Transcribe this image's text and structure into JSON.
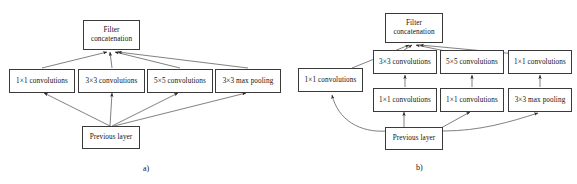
{
  "figure": {
    "background_color": "#ffffff",
    "stroke_color": "#3a3a3a",
    "text_color": "#111111"
  },
  "diagram_a": {
    "caption": "a)",
    "output_node": {
      "label": "Filter\nconcatenation"
    },
    "branches": [
      {
        "label": "1×1 convolutions"
      },
      {
        "label": "3×3 convolutions"
      },
      {
        "label": "5×5 convolutions"
      },
      {
        "label": "3×3 max pooling"
      }
    ],
    "input_node": {
      "label": "Previous layer"
    }
  },
  "diagram_b": {
    "caption": "b)",
    "output_node": {
      "label": "Filter\nconcatenation"
    },
    "left_branch": {
      "label": "1×1 convolutions"
    },
    "top_row": [
      {
        "label": "3×3 convolutions"
      },
      {
        "label": "5×5 convolutions"
      },
      {
        "label": "1×1 convolutions"
      }
    ],
    "bottom_row": [
      {
        "label": "1×1 convolutions"
      },
      {
        "label": "1×1 convolutions"
      },
      {
        "label": "3×3 max pooling"
      }
    ],
    "input_node": {
      "label": "Previous layer"
    }
  }
}
